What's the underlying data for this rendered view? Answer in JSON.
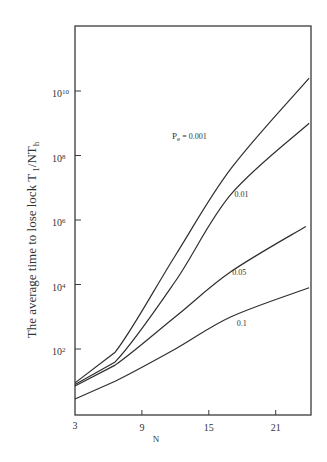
{
  "chart_data": {
    "type": "line",
    "title": "",
    "xlabel": "N",
    "ylabel": "The average time to lose lock T1/NTh",
    "ylabel_parts": {
      "main": "The average time to lose lock T",
      "sub1": "1",
      "mid": "/NT",
      "sub2": "h"
    },
    "xscale": "linear",
    "yscale": "log",
    "xlim": [
      3,
      24
    ],
    "ylim_log10": [
      0,
      12
    ],
    "xticks": [
      3,
      9,
      15,
      21
    ],
    "xtick_labels": [
      "3",
      "9",
      "15",
      "21"
    ],
    "yticks_log10": [
      2,
      4,
      6,
      8,
      10
    ],
    "ytick_labels": [
      {
        "base": "10",
        "exp": "2"
      },
      {
        "base": "10",
        "exp": "4"
      },
      {
        "base": "10",
        "exp": "6"
      },
      {
        "base": "10",
        "exp": "8"
      },
      {
        "base": "10",
        "exp": "10"
      }
    ],
    "grid": false,
    "legend": "inline curve labels",
    "series": [
      {
        "name": "Pe = 0.001",
        "label": "0.001",
        "x": [
          3,
          6.6,
          12,
          17,
          24
        ],
        "log10_y": [
          0.95,
          1.9,
          4.9,
          7.6,
          10.4
        ],
        "label_pos": {
          "x": 11.7,
          "log10_y": 8.5
        }
      },
      {
        "name": "Pe = 0.01",
        "label": "0.01",
        "x": [
          3,
          6.6,
          12,
          17,
          24
        ],
        "log10_y": [
          0.9,
          1.6,
          4.1,
          6.8,
          9.0
        ],
        "label_pos": {
          "x": 17.3,
          "log10_y": 6.7
        }
      },
      {
        "name": "Pe = 0.05",
        "label": "0.05",
        "x": [
          3,
          6.6,
          12,
          17,
          23.7
        ],
        "log10_y": [
          0.85,
          1.5,
          3.0,
          4.4,
          5.8
        ],
        "label_pos": {
          "x": 17.1,
          "log10_y": 4.3
        }
      },
      {
        "name": "Pe = 0.1",
        "label": "0.1",
        "x": [
          3,
          6.6,
          12,
          17,
          24
        ],
        "log10_y": [
          0.45,
          1.0,
          2.0,
          3.0,
          3.9
        ],
        "label_pos": {
          "x": 17.5,
          "log10_y": 2.7
        }
      }
    ],
    "annotation": {
      "prefix": "P",
      "sub": "e",
      "suffix": " = 0.001"
    }
  },
  "colors": {
    "line": "#2f2f2f",
    "axis": "#3a3a3a",
    "background": "#ffffff"
  }
}
